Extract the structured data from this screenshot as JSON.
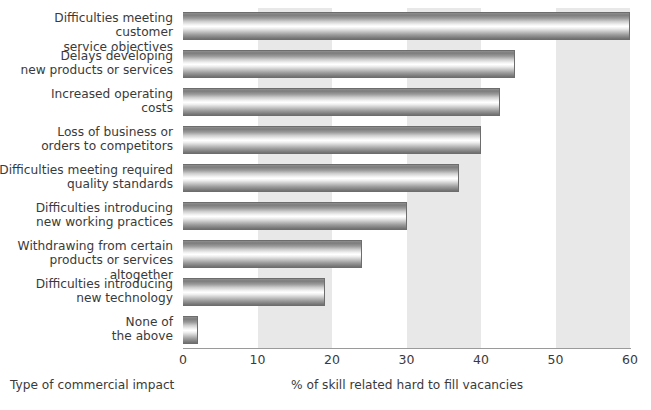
{
  "chart_data": {
    "type": "bar",
    "orientation": "horizontal",
    "title": "",
    "xlabel": "% of skill related hard to fill vacancies",
    "ylabel": "Type of commercial impact",
    "xlim": [
      0,
      60
    ],
    "xticks": [
      0,
      10,
      20,
      30,
      40,
      50,
      60
    ],
    "xtick_labels": [
      "0",
      "10",
      "20",
      "30",
      "40",
      "50",
      "60"
    ],
    "grid": false,
    "shaded_bands": [
      [
        10,
        20
      ],
      [
        30,
        40
      ],
      [
        50,
        60
      ]
    ],
    "legend": null,
    "categories": [
      "Difficulties meeting customer service objectives",
      "Delays developing new products or services",
      "Increased operating costs",
      "Loss of business or orders to competitors",
      "Difficulties meeting required quality standards",
      "Difficulties introducing new working practices",
      "Withdrawing from certain products or services altogether",
      "Difficulties introducing new technology",
      "None of the above"
    ],
    "category_lines": [
      [
        "Difficulties meeting customer",
        "service objectives"
      ],
      [
        "Delays developing",
        "new products or services"
      ],
      [
        "Increased operating",
        "costs"
      ],
      [
        "Loss of business or",
        "orders to competitors"
      ],
      [
        "Difficulties meeting required",
        "quality standards"
      ],
      [
        "Difficulties introducing",
        "new working practices"
      ],
      [
        "Withdrawing from certain",
        "products or services altogether"
      ],
      [
        "Difficulties introducing",
        "new technology"
      ],
      [
        "None of",
        "the above"
      ]
    ],
    "values": [
      60,
      44.5,
      42.5,
      40,
      37,
      30,
      24,
      19,
      2
    ],
    "bar_style": "vertical-gradient-grey",
    "colors": {
      "band": "#e8e8e8",
      "bar_edge": "#6d6d6d",
      "bar_light": "#ffffff",
      "bar_dark": "#7c7c7c",
      "text": "#3a3a3a",
      "axis": "#9a9a9a",
      "background": "#ffffff"
    }
  }
}
